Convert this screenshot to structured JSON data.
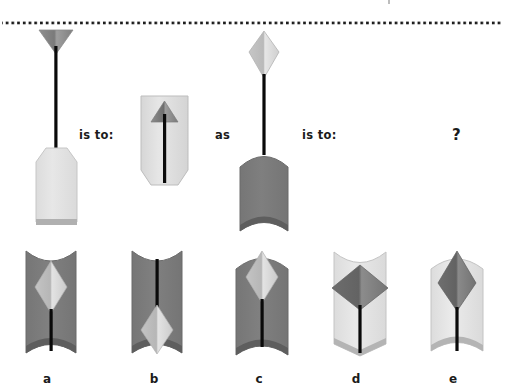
{
  "page": {
    "width": 507,
    "height": 390,
    "background": "#ffffff",
    "type": "visual-analogy-puzzle",
    "divider": {
      "name": "dotted-rule",
      "color": "#1b1b1b",
      "dot_size": 2.6,
      "gap": 3.1,
      "y": 13,
      "x_start": 2,
      "x_end": 503
    }
  },
  "relation_labels": {
    "is_to_1": "is to:",
    "as": "as",
    "is_to_2": "is to:",
    "question": "?"
  },
  "colors": {
    "body_light": "#e2e2e2",
    "body_light_edge": "#cfcfcf",
    "body_dark": "#7c7c7c",
    "body_dark_edge": "#5c5c5c",
    "shape_light": "#d2d2d2",
    "shape_light_hi": "#ececec",
    "shape_dark": "#6b6b6b",
    "shape_dark_hi": "#8a8a8a",
    "stem": "#0a0a0a",
    "footer_bar": "#a8a8a8",
    "text": "#1b1b1b"
  },
  "prompt_figures": [
    {
      "id": "prompt-a",
      "name": "prompt-figure-1",
      "order": 1,
      "body_shade": "light",
      "body_top": "angled-corners",
      "body_bottom": "flat-with-bar",
      "head_shape": "triangle-down",
      "head_shade": "dark",
      "head_position": "above-body",
      "stem": "long-external"
    },
    {
      "id": "prompt-b",
      "name": "prompt-figure-2",
      "order": 2,
      "body_shade": "light",
      "body_top": "flat",
      "body_bottom": "angled-corners",
      "head_shape": "triangle-up",
      "head_shade": "dark",
      "head_position": "inside-top",
      "stem": "internal"
    },
    {
      "id": "prompt-c",
      "name": "prompt-figure-3",
      "order": 3,
      "body_shade": "dark",
      "body_top": "convex",
      "body_bottom": "concave",
      "head_shape": "diamond",
      "head_shade": "light",
      "head_position": "above-body",
      "stem": "long-external"
    }
  ],
  "options": [
    {
      "id": "a",
      "letter": "a",
      "name": "option-a",
      "body_shade": "dark",
      "body_top": "concave",
      "body_bottom": "concave",
      "shape": "diamond",
      "shape_shade": "light",
      "shape_position": "upper",
      "stem": "below-shape"
    },
    {
      "id": "b",
      "letter": "b",
      "name": "option-b",
      "body_shade": "dark",
      "body_top": "concave",
      "body_bottom": "concave",
      "shape": "diamond",
      "shape_shade": "light",
      "shape_position": "lower",
      "stem": "above-shape"
    },
    {
      "id": "c",
      "letter": "c",
      "name": "option-c",
      "body_shade": "dark",
      "body_top": "convex",
      "body_bottom": "concave",
      "shape": "diamond",
      "shape_shade": "light",
      "shape_position": "upper",
      "stem": "below-shape"
    },
    {
      "id": "d",
      "letter": "d",
      "name": "option-d",
      "body_shade": "light",
      "body_top": "concave",
      "body_bottom": "angled-point",
      "shape": "diamond-wide",
      "shape_shade": "dark",
      "shape_position": "upper",
      "stem": "below-shape"
    },
    {
      "id": "e",
      "letter": "e",
      "name": "option-e",
      "body_shade": "light",
      "body_top": "convex",
      "body_bottom": "concave",
      "shape": "diamond-tall",
      "shape_shade": "dark",
      "shape_position": "upper",
      "stem": "below-shape"
    }
  ]
}
